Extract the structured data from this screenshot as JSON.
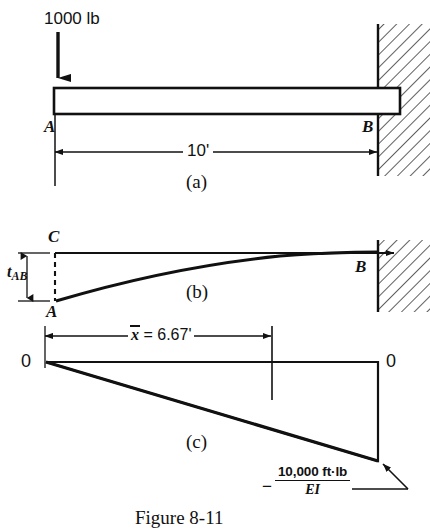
{
  "figure": {
    "caption": "Figure 8-11",
    "panels": [
      {
        "id": "a",
        "caption": "(a)",
        "load_label": "1000 lb",
        "point_left": "A",
        "point_right": "B",
        "span_label": "10'",
        "description": "cantilever-beam-with-point-load"
      },
      {
        "id": "b",
        "caption": "(b)",
        "point_tangent": "C",
        "point_left": "A",
        "point_right": "B",
        "deviation_label_main": "t",
        "deviation_label_sub": "AB",
        "description": "elastic-curve-with-tangential-deviation"
      },
      {
        "id": "c",
        "caption": "(c)",
        "centroid_label_symbol": "x",
        "centroid_label_value": " = 6.67'",
        "zero_left": "0",
        "zero_right": "0",
        "moment_sign": "−",
        "moment_numerator": "10,000 ft·lb",
        "moment_denominator": "EI",
        "description": "m-over-ei-diagram"
      }
    ],
    "colors": {
      "ink": "#111111",
      "paper": "#ffffff",
      "hatch": "#333333"
    }
  }
}
